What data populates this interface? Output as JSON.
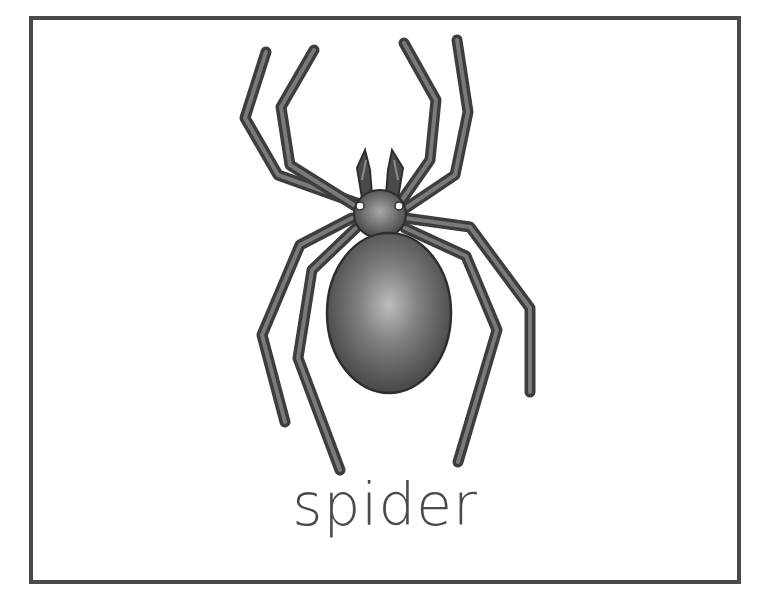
{
  "card": {
    "caption": "spider",
    "border_color": "#4a4a4a",
    "background_color": "#ffffff"
  },
  "illustration": {
    "subject": "spider-icon",
    "body_color": "#555555",
    "leg_color": "#4f4f4f",
    "leg_count": 8
  }
}
